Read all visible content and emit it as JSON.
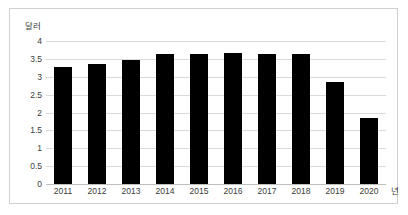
{
  "chart_data": {
    "type": "bar",
    "title": "",
    "subtitle": "",
    "xlabel": "년",
    "ylabel": "달러",
    "categories": [
      "2011",
      "2012",
      "2013",
      "2014",
      "2015",
      "2016",
      "2017",
      "2018",
      "2019",
      "2020"
    ],
    "values": [
      3.28,
      3.35,
      3.48,
      3.65,
      3.65,
      3.66,
      3.65,
      3.65,
      2.85,
      1.85
    ],
    "series": [
      {
        "name": "달러",
        "values": [
          3.28,
          3.35,
          3.48,
          3.65,
          3.65,
          3.66,
          3.65,
          3.65,
          2.85,
          1.85
        ]
      }
    ],
    "ylim": [
      0,
      4
    ],
    "yticks": [
      0,
      0.5,
      1,
      1.5,
      2,
      2.5,
      3,
      3.5,
      4
    ],
    "ytick_labels": [
      "0",
      "0.5",
      "1",
      "1.5",
      "2",
      "2.5",
      "3",
      "3.5",
      "4"
    ],
    "grid": true,
    "grid_axis": "y",
    "legend": false,
    "legend_position": "none",
    "bar_color": "#000000",
    "grid_color": "#D9D9D9",
    "axis_color": "#BFBFBF",
    "text_color": "#3A3A3A",
    "border_color": "#D0D0D0",
    "background": "#FFFFFF"
  }
}
